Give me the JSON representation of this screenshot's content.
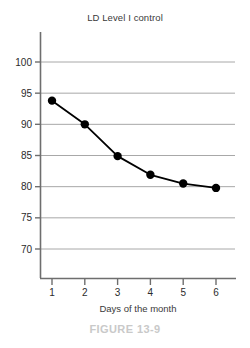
{
  "figure": {
    "caption": "FIGURE 13-9"
  },
  "chart_data": {
    "type": "line",
    "title": "LD Level I control",
    "xlabel": "Days of the month",
    "ylabel": "",
    "x": [
      1,
      2,
      3,
      4,
      5,
      6
    ],
    "values": [
      93.8,
      90.0,
      84.9,
      81.9,
      80.5,
      79.8
    ],
    "xtick_labels": [
      "1",
      "2",
      "3",
      "4",
      "5",
      "6"
    ],
    "ytick_labels": [
      "100",
      "95",
      "90",
      "85",
      "80",
      "75",
      "70"
    ],
    "yticks": [
      100,
      95,
      90,
      85,
      80,
      75,
      70
    ],
    "xlim": [
      0.5,
      6.6
    ],
    "ylim": [
      67,
      103.5
    ],
    "grid": "horizontal",
    "legend": "none",
    "marker": "filled-circle",
    "marker_color": "#000000",
    "line_color": "#000000",
    "grid_color": "#a8a8a8",
    "axis_color": "#6e6e6e"
  }
}
